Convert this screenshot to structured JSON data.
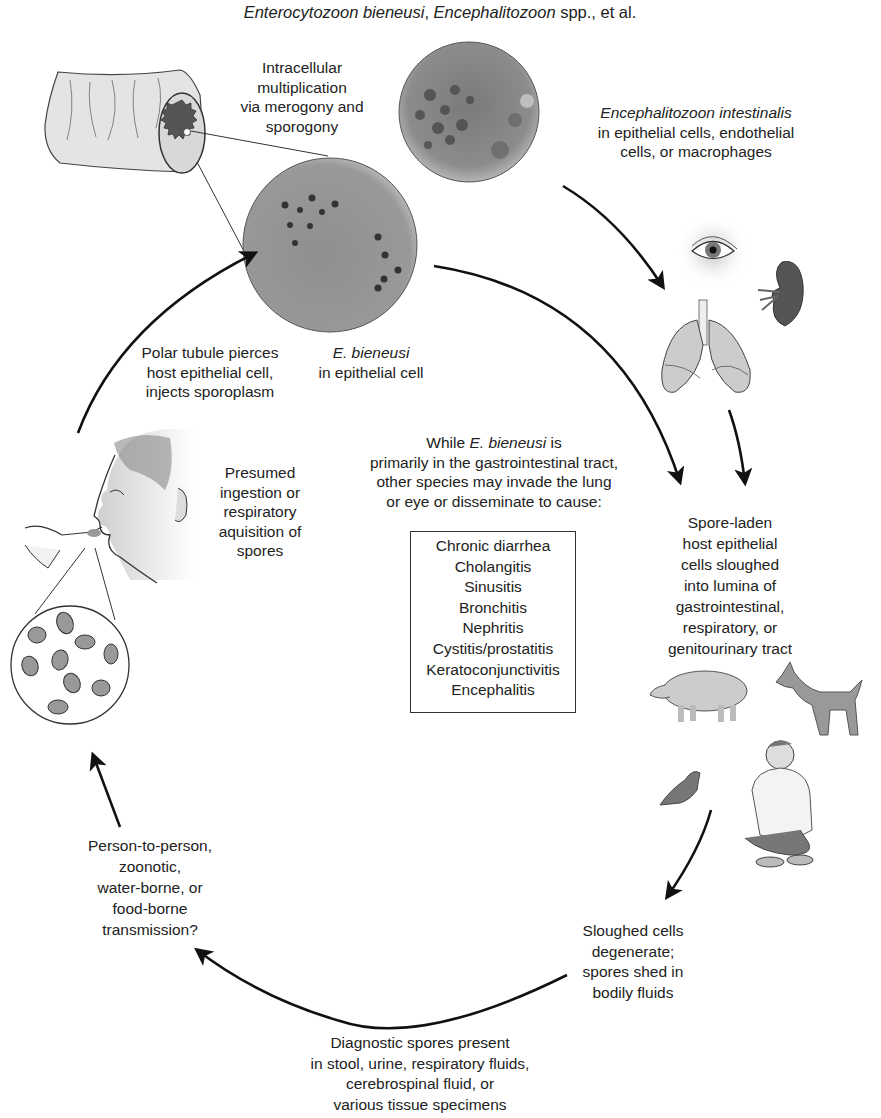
{
  "title": {
    "species_1": "Enterocytozoon bieneusi",
    "sep": ", ",
    "species_2": "Encephalitozoon",
    "suffix": " spp., et al."
  },
  "stages": {
    "intracellular": {
      "lines": [
        "Intracellular",
        "multiplication",
        "via merogony and",
        "sporogony"
      ]
    },
    "e_intestinalis": {
      "species": "Encephalitozoon intestinalis",
      "lines": [
        "in epithelial cells, endothelial",
        "cells, or macrophages"
      ]
    },
    "e_bieneusi_cell": {
      "species": "E. bieneusi",
      "lines": [
        "in epithelial cell"
      ]
    },
    "polar_tubule": {
      "lines": [
        "Polar tubule pierces",
        "host epithelial cell,",
        "injects sporoplasm"
      ]
    },
    "ingestion": {
      "lines": [
        "Presumed",
        "ingestion or",
        "respiratory",
        "aquisition of",
        "spores"
      ]
    },
    "center_note": {
      "prefix": "While ",
      "species": "E. bieneusi",
      "suffix": " is",
      "lines": [
        "primarily in the gastrointestinal tract,",
        "other species may invade the lung",
        "or eye or disseminate to cause:"
      ]
    },
    "spore_laden": {
      "lines": [
        "Spore-laden",
        "host epithelial",
        "cells sloughed",
        "into lumina of",
        "gastrointestinal,",
        "respiratory, or",
        "genitourinary tract"
      ]
    },
    "sloughed": {
      "lines": [
        "Sloughed cells",
        "degenerate;",
        "spores shed in",
        "bodily fluids"
      ]
    },
    "diagnostic": {
      "lines": [
        "Diagnostic spores present",
        "in stool, urine, respiratory fluids,",
        "cerebrospinal fluid, or",
        "various tissue specimens"
      ]
    },
    "transmission": {
      "lines": [
        "Person-to-person,",
        "zoonotic,",
        "water-borne, or",
        "food-borne",
        "transmission?"
      ]
    }
  },
  "diseases": [
    "Chronic diarrhea",
    "Cholangitis",
    "Sinusitis",
    "Bronchitis",
    "Nephritis",
    "Cystitis/prostatitis",
    "Keratoconjunctivitis",
    "Encephalitis"
  ],
  "illustrations": [
    "intestine-cross-section",
    "e-intestinalis-micrograph",
    "e-bieneusi-micrograph",
    "eye",
    "kidney",
    "lungs",
    "human-head-eating",
    "spores-magnified",
    "pig",
    "dog",
    "pigeon",
    "squatting-man"
  ],
  "colors": {
    "text": "#222222",
    "arrow": "#111111",
    "micrograph": "#8a8a8a",
    "illustration_fill": "#c8c8c8"
  }
}
